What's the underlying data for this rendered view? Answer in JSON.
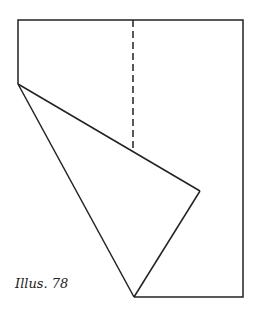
{
  "caption": "Illus. 78",
  "colors": {
    "stroke": "#222222",
    "background": "#ffffff"
  },
  "diagram": {
    "type": "paper-fold",
    "outline_points": [
      [
        18,
        20
      ],
      [
        243,
        20
      ],
      [
        243,
        297
      ],
      [
        134,
        297
      ]
    ],
    "fold_lines": [
      {
        "from": [
          18,
          20
        ],
        "to": [
          18,
          84
        ]
      },
      {
        "from": [
          18,
          84
        ],
        "to": [
          134,
          297
        ]
      },
      {
        "from": [
          18,
          84
        ],
        "to": [
          200,
          191
        ]
      },
      {
        "from": [
          200,
          191
        ],
        "to": [
          134,
          297
        ]
      }
    ],
    "dashed_line": {
      "from": [
        133,
        20
      ],
      "to": [
        133,
        150
      ]
    }
  }
}
